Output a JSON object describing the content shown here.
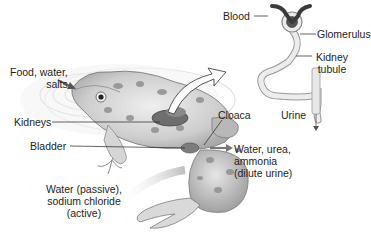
{
  "diagram": {
    "labels": {
      "food_water_salts": [
        "Food, water,",
        "salts"
      ],
      "kidneys": "Kidneys",
      "bladder": "Bladder",
      "water_passive": [
        "Water (passive),",
        "sodium chloride",
        "(active)"
      ],
      "cloaca": "Cloaca",
      "water_urea": [
        "Water, urea,",
        "ammonia",
        "(dilute urine)"
      ],
      "blood": "Blood",
      "glomerulus": "Glomerulus",
      "kidney_tubule": [
        "Kidney",
        "tubule"
      ],
      "urine": "Urine"
    },
    "colors": {
      "frog_body": "#cfcfcf",
      "frog_spots": "#8a8a8a",
      "kidney": "#6e6e6e",
      "nephron_tube": "#e4e4e4",
      "blood_vessel": "#3a3a3a",
      "leader_line": "#222222",
      "arrow_fill": "#777777"
    }
  }
}
